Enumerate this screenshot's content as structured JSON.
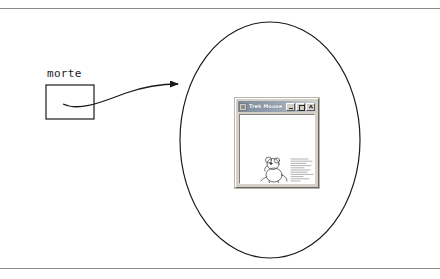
{
  "page": {
    "width": 440,
    "height": 279,
    "background": "#ffffff",
    "rule_color": "#8a8a8a"
  },
  "diagram": {
    "type": "annotated-screenshot",
    "node": {
      "label": "morte",
      "shape": "rectangle",
      "x": 46,
      "y": 85,
      "width": 48,
      "height": 34,
      "stroke": "#1a1a1a"
    },
    "connector": {
      "kind": "curved-arrow",
      "from": "morte-box",
      "to": "region-ellipse",
      "arrowhead": "filled-triangle",
      "stroke": "#1a1a1a"
    },
    "region": {
      "shape": "ellipse",
      "cx": 270,
      "cy": 140,
      "rx": 90,
      "ry": 118,
      "stroke": "#1a1a1a",
      "fill": "none"
    }
  },
  "app_window": {
    "title": "Trek Mouse",
    "icon": "application-icon",
    "controls": [
      {
        "name": "minimize",
        "glyph": "_"
      },
      {
        "name": "maximize",
        "glyph": "□"
      },
      {
        "name": "close",
        "glyph": "×"
      }
    ],
    "client": {
      "illustration": "seated-mouse-line-drawing",
      "text_block": "illegible-body-text-lines",
      "background": "#ffffff"
    },
    "chrome_color": "#d4d0c8",
    "titlebar_color": "#7b8a9e"
  }
}
